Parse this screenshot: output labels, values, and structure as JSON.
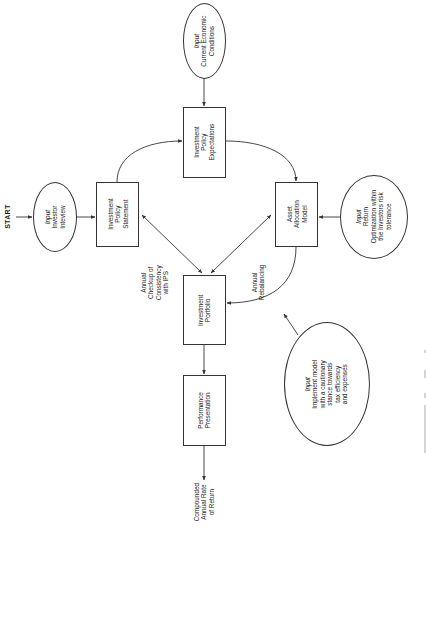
{
  "diagram": {
    "orientation": "rotated 90 degrees counter-clockwise; text reads bottom-to-top",
    "start_label": "START",
    "nodes": {
      "investor_interview": {
        "shape": "ellipse",
        "lines": [
          "Input",
          "Investor",
          "Inteview"
        ]
      },
      "investment_policy_statement": {
        "shape": "box",
        "lines": [
          "Investment",
          "Policy",
          "Statement"
        ]
      },
      "current_economic_conditions": {
        "shape": "ellipse",
        "lines": [
          "Input",
          "Current Economic",
          "Conditions"
        ]
      },
      "investment_policy_expectations": {
        "shape": "box",
        "lines": [
          "Investment",
          "Policy",
          "Expectations"
        ]
      },
      "asset_allocation_model": {
        "shape": "box",
        "lines": [
          "Asset",
          "Allocation",
          "Model"
        ]
      },
      "return_optimization": {
        "shape": "ellipse",
        "lines": [
          "Input",
          "Return",
          "Optimization within",
          "the Investors risk",
          "tolerance"
        ]
      },
      "investment_portfolio": {
        "shape": "box",
        "lines": [
          "Investment",
          "Portfolio"
        ]
      },
      "implementation": {
        "shape": "ellipse",
        "lines": [
          "Input",
          "Implement model",
          "with a cautionary",
          "stance towards",
          "tax efficiency",
          "and expenses"
        ]
      },
      "performance_presentation": {
        "shape": "box",
        "lines": [
          "Performance",
          "Presentation"
        ]
      }
    },
    "end_label": {
      "lines": [
        "Compounded",
        "Annual Rate",
        "of Return"
      ]
    },
    "edge_labels": {
      "annual_checkup": {
        "lines": [
          "Annual",
          "Checkup of",
          "Consistency",
          "with IPS"
        ]
      },
      "annual_rebalancing": {
        "lines": [
          "Annual",
          "Rebalancing"
        ]
      }
    },
    "edges": [
      {
        "from": "start",
        "to": "investor_interview"
      },
      {
        "from": "investor_interview",
        "to": "investment_policy_statement"
      },
      {
        "from": "investment_policy_statement",
        "to": "investment_policy_expectations",
        "style": "curved"
      },
      {
        "from": "current_economic_conditions",
        "to": "investment_policy_expectations"
      },
      {
        "from": "investment_policy_expectations",
        "to": "asset_allocation_model",
        "style": "curved"
      },
      {
        "from": "return_optimization",
        "to": "asset_allocation_model"
      },
      {
        "from": "investment_policy_statement",
        "to": "investment_portfolio",
        "bidirectional": true,
        "label": "annual_checkup"
      },
      {
        "from": "asset_allocation_model",
        "to": "investment_portfolio",
        "bidirectional": true
      },
      {
        "from": "asset_allocation_model",
        "to": "investment_portfolio",
        "style": "curved",
        "label": "annual_rebalancing"
      },
      {
        "from": "implementation",
        "to": "annual_rebalancing_curve"
      },
      {
        "from": "investment_portfolio",
        "to": "performance_presentation"
      },
      {
        "from": "performance_presentation",
        "to": "end"
      }
    ],
    "colors": {
      "stroke": "#333333",
      "text": "#1a1a1a",
      "background": "#ffffff"
    }
  }
}
